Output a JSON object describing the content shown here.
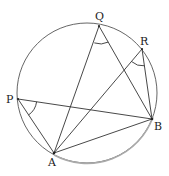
{
  "diagram": {
    "type": "circle-geometry",
    "circle": {
      "cx": 87,
      "cy": 93,
      "r": 70,
      "stroke": "#555555",
      "highlight_arc_stroke": "#aaaaaa"
    },
    "points": {
      "P": {
        "label": "P",
        "x": 18,
        "y": 99
      },
      "Q": {
        "label": "Q",
        "x": 99,
        "y": 26
      },
      "R": {
        "label": "R",
        "x": 142,
        "y": 49
      },
      "A": {
        "label": "A",
        "x": 54,
        "y": 153
      },
      "B": {
        "label": "B",
        "x": 152,
        "y": 119
      }
    },
    "segments": [
      [
        "P",
        "A"
      ],
      [
        "P",
        "B"
      ],
      [
        "Q",
        "A"
      ],
      [
        "Q",
        "B"
      ],
      [
        "R",
        "A"
      ],
      [
        "R",
        "B"
      ],
      [
        "A",
        "B"
      ]
    ],
    "marked_angles": [
      "APB",
      "AQB",
      "ARB"
    ],
    "highlighted_arc": [
      "A",
      "B"
    ],
    "line_color": "#333333"
  }
}
